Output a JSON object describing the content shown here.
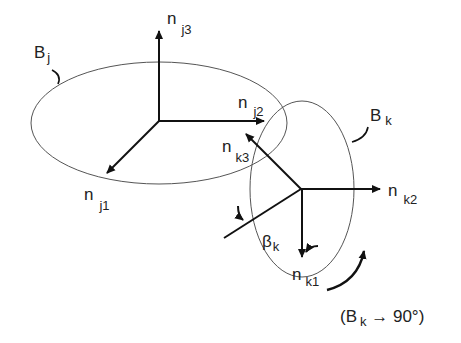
{
  "frames": {
    "j": {
      "body_label": "B",
      "body_sub": "j",
      "axes": [
        {
          "label": "n",
          "sub": "j1"
        },
        {
          "label": "n",
          "sub": "j2"
        },
        {
          "label": "n",
          "sub": "j3"
        }
      ]
    },
    "k": {
      "body_label": "B",
      "body_sub": "k",
      "axes": [
        {
          "label": "n",
          "sub": "k1"
        },
        {
          "label": "n",
          "sub": "k2"
        },
        {
          "label": "n",
          "sub": "k3"
        }
      ],
      "angle_label": "β",
      "angle_sub": "k"
    }
  },
  "annotation": {
    "open": "(B",
    "sub": "k",
    "rest": " → 90°)"
  },
  "colors": {
    "stroke": "#111111",
    "ellipse": "#555555"
  }
}
